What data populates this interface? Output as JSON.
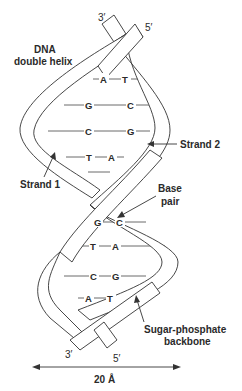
{
  "title": "DNA double helix",
  "title_lines": [
    "DNA",
    "double helix"
  ],
  "strand_labels": {
    "strand1": "Strand 1",
    "strand2": "Strand 2"
  },
  "annotations": {
    "base_pair_lines": [
      "Base",
      "pair"
    ],
    "backbone_lines": [
      "Sugar-phosphate",
      "backbone"
    ]
  },
  "ends": {
    "top_left": "3′",
    "top_right": "5′",
    "bottom_left": "3′",
    "bottom_right": "5′"
  },
  "width_label": "20 Å",
  "base_pairs": [
    {
      "left": "A",
      "right": "T"
    },
    {
      "left": "G",
      "right": "C"
    },
    {
      "left": "C",
      "right": "G"
    },
    {
      "left": "T",
      "right": "A"
    },
    {
      "left": "G",
      "right": "C"
    },
    {
      "left": "T",
      "right": "A"
    },
    {
      "left": "C",
      "right": "G"
    },
    {
      "left": "A",
      "right": "T"
    }
  ]
}
